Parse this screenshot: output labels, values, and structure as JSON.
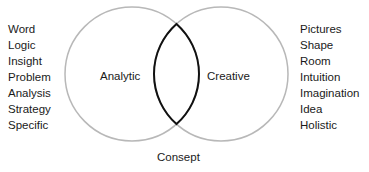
{
  "diagram": {
    "type": "venn",
    "left_circle": {
      "label": "Analytic",
      "cx": 132,
      "cy": 74,
      "r": 67,
      "stroke": "#b8b8b8"
    },
    "right_circle": {
      "label": "Creative",
      "cx": 221,
      "cy": 74,
      "r": 67,
      "stroke": "#b8b8b8"
    },
    "intersection": {
      "label": "Consept",
      "stroke": "#111111"
    },
    "left_list": [
      "Word",
      "Logic",
      "Insight",
      "Problem",
      "Analysis",
      "Strategy",
      "Specific"
    ],
    "right_list": [
      "Pictures",
      "Shape",
      "Room",
      "Intuition",
      "Imagination",
      "Idea",
      "Holistic"
    ]
  }
}
